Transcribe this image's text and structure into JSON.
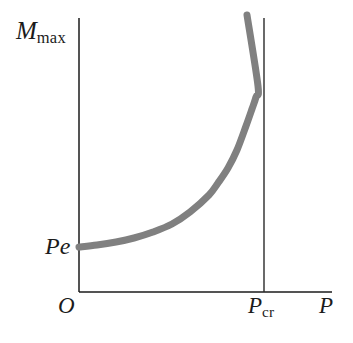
{
  "figure": {
    "background_color": "#ffffff",
    "axis_color": "#1b1b1b",
    "curve_color": "#808080",
    "text_color": "#1b1b1b"
  },
  "labels": {
    "y_axis_symbol": "M",
    "y_axis_subscript": "max",
    "x_axis_symbol": "P",
    "origin": "O",
    "critical_symbol": "P",
    "critical_subscript": "cr",
    "initial_value": "Pe"
  },
  "chart_data": {
    "type": "line",
    "title": "",
    "xlabel": "P",
    "ylabel": "M_max",
    "grid": false,
    "legend": null,
    "axis_style": "open-axes",
    "xlim": [
      0,
      1.35
    ],
    "ylim": [
      0,
      1.0
    ],
    "annotations": [
      {
        "name": "y-axis-label",
        "text": "M_max",
        "position": "top-left, outside y-axis",
        "px": [
          16,
          18
        ]
      },
      {
        "name": "initial-moment-label",
        "text": "Pe",
        "position": "left of y-axis at curve start",
        "px": [
          45,
          234
        ]
      },
      {
        "name": "origin-label",
        "text": "O",
        "position": "below-left of origin",
        "px": [
          58,
          294
        ]
      },
      {
        "name": "critical-load-label",
        "text": "P_cr",
        "position": "below x-axis at asymptote",
        "px": [
          248,
          294
        ]
      },
      {
        "name": "x-axis-label",
        "text": "P",
        "position": "right end of x-axis",
        "px": [
          319,
          294
        ]
      }
    ],
    "asymptote": {
      "orientation": "vertical",
      "x_label": "P_cr",
      "x_pixel": 264,
      "y_pixel_top": 18,
      "y_pixel_bottom": 292,
      "color": "#2a2a2a",
      "width_px": 1.4
    },
    "axes_pixels": {
      "y_axis_x": 79,
      "y_axis_top": 18,
      "y_axis_bottom": 292,
      "x_axis_y": 292,
      "x_axis_left": 79,
      "x_axis_right": 332
    },
    "series": [
      {
        "name": "M_max vs P",
        "description": "Maximum bending moment grows from initial eccentric-load value Pe and diverges asymptotically at the critical buckling load P_cr",
        "color": "#808080",
        "linewidth_px": 7,
        "x": [
          0.0,
          0.1,
          0.2,
          0.3,
          0.4,
          0.5,
          0.6,
          0.7,
          0.75,
          0.8,
          0.85,
          0.9,
          0.93,
          0.95,
          0.965
        ],
        "y": [
          0.155,
          0.165,
          0.18,
          0.2,
          0.228,
          0.268,
          0.325,
          0.415,
          0.475,
          0.555,
          0.65,
          0.775,
          0.86,
          0.925,
          0.975
        ],
        "points_pixels": [
          [
            79,
            247
          ],
          [
            97,
            245
          ],
          [
            116,
            242
          ],
          [
            134,
            238
          ],
          [
            153,
            232
          ],
          [
            172,
            224
          ],
          [
            190,
            212
          ],
          [
            209,
            195
          ],
          [
            218,
            183
          ],
          [
            228,
            168
          ],
          [
            237,
            150
          ],
          [
            246,
            126
          ],
          [
            252,
            109
          ],
          [
            256,
            97
          ],
          [
            258,
            86
          ]
        ],
        "curve_start_px": [
          79,
          247
        ],
        "curve_end_px": [
          247,
          15
        ]
      }
    ]
  }
}
